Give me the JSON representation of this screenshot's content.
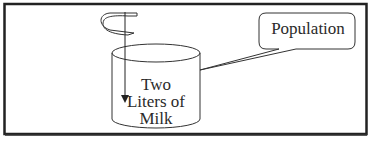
{
  "diagram": {
    "container": {
      "label": "Two Liters of Milk",
      "lines": [
        "Two",
        "Liters of",
        "Milk"
      ]
    },
    "callout": {
      "label": "Population"
    },
    "icons": [
      "stirring-spiral-icon",
      "down-arrow-icon"
    ],
    "colors": {
      "stroke": "#222222",
      "background": "#ffffff"
    }
  }
}
